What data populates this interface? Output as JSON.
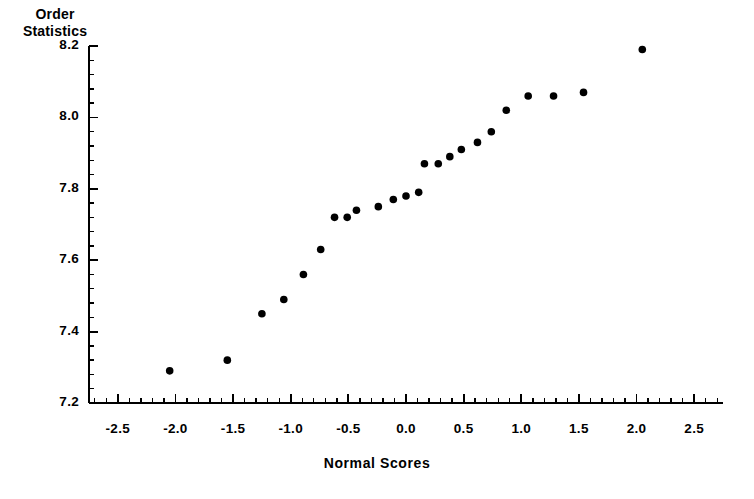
{
  "chart_data": {
    "type": "scatter",
    "title": "",
    "xlabel": "Normal Scores",
    "ylabel": "Order Statistics",
    "ylabel_lines": [
      "Order",
      "Statistics"
    ],
    "xlim": [
      -2.75,
      2.75
    ],
    "ylim": [
      7.2,
      8.2
    ],
    "grid": false,
    "legend": null,
    "xticks": [
      -2.5,
      -2.0,
      -1.5,
      -1.0,
      -0.5,
      0.0,
      0.5,
      1.0,
      1.5,
      2.0,
      2.5
    ],
    "xtick_labels": [
      "-2.5",
      "-2.0",
      "-1.5",
      "-1.0",
      "-0.5",
      "0.0",
      "0.5",
      "1.0",
      "1.5",
      "2.0",
      "2.5"
    ],
    "yticks": [
      7.2,
      7.4,
      7.6,
      7.8,
      8.0,
      8.2
    ],
    "ytick_labels": [
      "7.2",
      "7.4",
      "7.6",
      "7.8",
      "8.0",
      "8.2"
    ],
    "x_minor_per_major": 5,
    "y_minor_per_major": 5,
    "marker": "filled-circle",
    "marker_color": "#000000",
    "marker_size_px": 5,
    "points": [
      {
        "x": -2.05,
        "y": 7.29
      },
      {
        "x": -1.55,
        "y": 7.32
      },
      {
        "x": -1.25,
        "y": 7.45
      },
      {
        "x": -1.06,
        "y": 7.49
      },
      {
        "x": -0.89,
        "y": 7.56
      },
      {
        "x": -0.74,
        "y": 7.63
      },
      {
        "x": -0.62,
        "y": 7.72
      },
      {
        "x": -0.51,
        "y": 7.72
      },
      {
        "x": -0.43,
        "y": 7.74
      },
      {
        "x": -0.24,
        "y": 7.75
      },
      {
        "x": -0.11,
        "y": 7.77
      },
      {
        "x": 0.0,
        "y": 7.78
      },
      {
        "x": 0.11,
        "y": 7.79
      },
      {
        "x": 0.16,
        "y": 7.87
      },
      {
        "x": 0.28,
        "y": 7.87
      },
      {
        "x": 0.38,
        "y": 7.89
      },
      {
        "x": 0.48,
        "y": 7.91
      },
      {
        "x": 0.62,
        "y": 7.93
      },
      {
        "x": 0.74,
        "y": 7.96
      },
      {
        "x": 0.87,
        "y": 8.02
      },
      {
        "x": 1.06,
        "y": 8.06
      },
      {
        "x": 1.28,
        "y": 8.06
      },
      {
        "x": 1.54,
        "y": 8.07
      },
      {
        "x": 2.05,
        "y": 8.19
      }
    ]
  }
}
